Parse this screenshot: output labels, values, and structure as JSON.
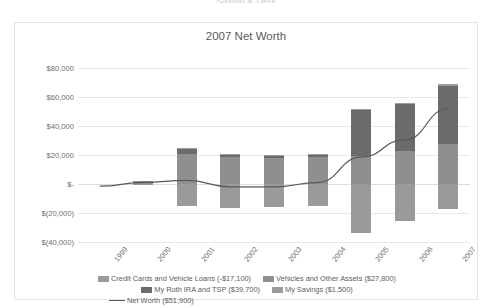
{
  "page": {
    "caption_cut_off": "Saving & Debt"
  },
  "chart_data": {
    "type": "bar",
    "subtype": "stacked-bar-with-line-overlay",
    "title": "2007 Net Worth",
    "xlabel": "",
    "ylabel": "",
    "ylim": [
      -40000,
      80000
    ],
    "ytick_values": [
      80000,
      60000,
      40000,
      20000,
      0,
      -20000,
      -40000
    ],
    "ytick_labels": [
      "$80,000",
      "$60,000",
      "$40,000",
      "$20,000",
      "$-",
      "$(20,000)",
      "$(40,000)"
    ],
    "grid": true,
    "legend_position": "bottom",
    "categories": [
      "1999",
      "2000",
      "2001",
      "2002",
      "2003",
      "2004",
      "2005",
      "2006",
      "2007"
    ],
    "series": [
      {
        "name": "Credit Cards and Vehicle Loans (-$17,100)",
        "short_name": "Credit Cards and Vehicle Loans",
        "total": -17100,
        "color": "#9a9a9a",
        "stack": "negative",
        "values": [
          0,
          -700,
          -15500,
          -16500,
          -16000,
          -15000,
          -33500,
          -25500,
          -17100
        ]
      },
      {
        "name": "Vehicles and Other Assets ($27,800)",
        "short_name": "Vehicles and Other Assets",
        "total": 27800,
        "color": "#8f8f8f",
        "stack": "positive",
        "values": [
          0,
          1800,
          20500,
          18500,
          18000,
          18500,
          19500,
          22500,
          27800
        ]
      },
      {
        "name": "My Roth IRA and TSP ($39,700)",
        "short_name": "My Roth IRA and TSP",
        "total": 39700,
        "color": "#6b6b6b",
        "stack": "positive",
        "values": [
          0,
          0,
          4000,
          1500,
          1500,
          2000,
          31500,
          32500,
          39700
        ]
      },
      {
        "name": "My Savings ($1,500)",
        "short_name": "My Savings",
        "total": 1500,
        "color": "#9c9c9c",
        "stack": "positive",
        "values": [
          0,
          0,
          500,
          500,
          500,
          500,
          1000,
          1000,
          1500
        ]
      }
    ],
    "line_series": {
      "name": "Net Worth ($51,900)",
      "short_name": "Net Worth",
      "total": 51900,
      "color": "#595959",
      "values": [
        -1500,
        1100,
        2500,
        -2000,
        -2000,
        1000,
        18500,
        30500,
        51900
      ]
    },
    "legend_entries": [
      {
        "label": "Credit Cards and Vehicle Loans (-$17,100)",
        "color": "#9a9a9a",
        "type": "swatch"
      },
      {
        "label": "Vehicles and Other Assets ($27,800)",
        "color": "#8f8f8f",
        "type": "swatch"
      },
      {
        "label": "My Roth IRA and TSP ($39,700)",
        "color": "#6b6b6b",
        "type": "swatch"
      },
      {
        "label": "My Savings ($1,500)",
        "color": "#9c9c9c",
        "type": "swatch"
      },
      {
        "label": "Net Worth ($51,900)",
        "color": "#595959",
        "type": "line"
      }
    ]
  }
}
